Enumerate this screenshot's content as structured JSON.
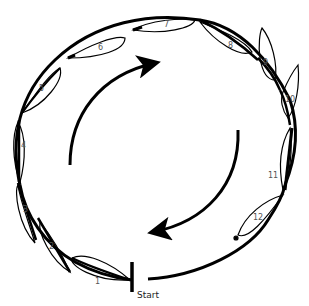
{
  "diagram": {
    "start_label": "Start",
    "stroke_color": "#000000",
    "label_color": "#555555",
    "leaves": [
      {
        "label": "1"
      },
      {
        "label": "2"
      },
      {
        "label": "3"
      },
      {
        "label": "4"
      },
      {
        "label": "5"
      },
      {
        "label": "6"
      },
      {
        "label": "7"
      },
      {
        "label": "8"
      },
      {
        "label": "9"
      },
      {
        "label": "10"
      },
      {
        "label": "11"
      },
      {
        "label": "12"
      }
    ],
    "inner_arrows": [
      {
        "name": "left-arc-arrow",
        "direction": "clockwise-up"
      },
      {
        "name": "right-arc-arrow",
        "direction": "clockwise-down"
      }
    ]
  }
}
